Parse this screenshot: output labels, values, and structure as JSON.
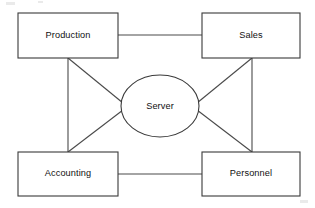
{
  "diagram": {
    "type": "network-topology",
    "background_color": "#ffffff",
    "line_color": "#4a4a4a",
    "text_color": "#111111",
    "canvas": {
      "width": 315,
      "height": 208
    },
    "nodes": [
      {
        "id": "production",
        "label": "Production",
        "shape": "rectangle",
        "x": 18,
        "y": 13,
        "width": 100,
        "height": 45,
        "cx": 68,
        "cy": 35.5
      },
      {
        "id": "sales",
        "label": "Sales",
        "shape": "rectangle",
        "x": 202,
        "y": 13,
        "width": 98,
        "height": 45,
        "cx": 251,
        "cy": 35.5
      },
      {
        "id": "accounting",
        "label": "Accounting",
        "shape": "rectangle",
        "x": 18,
        "y": 152,
        "width": 100,
        "height": 44,
        "cx": 68,
        "cy": 174
      },
      {
        "id": "personnel",
        "label": "Personnel",
        "shape": "rectangle",
        "x": 202,
        "y": 152,
        "width": 98,
        "height": 44,
        "cx": 251,
        "cy": 174
      },
      {
        "id": "server",
        "label": "Server",
        "shape": "ellipse",
        "cx": 160,
        "cy": 106,
        "rx": 39,
        "ry": 31
      }
    ],
    "edges": [
      {
        "id": "production-sales",
        "from": "production",
        "to": "sales",
        "style": "horizontal",
        "x1": 118,
        "y1": 35,
        "x2": 202,
        "y2": 35
      },
      {
        "id": "accounting-personnel",
        "from": "accounting",
        "to": "personnel",
        "style": "horizontal",
        "x1": 118,
        "y1": 174,
        "x2": 202,
        "y2": 174
      },
      {
        "id": "production-accounting",
        "from": "production",
        "to": "accounting",
        "style": "vertical",
        "x1": 68,
        "y1": 58,
        "x2": 68,
        "y2": 152
      },
      {
        "id": "sales-personnel",
        "from": "sales",
        "to": "personnel",
        "style": "vertical",
        "x1": 252,
        "y1": 58,
        "x2": 252,
        "y2": 152
      },
      {
        "id": "production-server",
        "from": "production",
        "to": "server",
        "style": "diagonal",
        "x1": 68,
        "y1": 58,
        "x2": 123,
        "y2": 104
      },
      {
        "id": "accounting-server",
        "from": "accounting",
        "to": "server",
        "style": "diagonal",
        "x1": 68,
        "y1": 152,
        "x2": 123,
        "y2": 109
      },
      {
        "id": "sales-server",
        "from": "sales",
        "to": "server",
        "style": "diagonal",
        "x1": 252,
        "y1": 58,
        "x2": 197,
        "y2": 104
      },
      {
        "id": "personnel-server",
        "from": "personnel",
        "to": "server",
        "style": "diagonal",
        "x1": 252,
        "y1": 152,
        "x2": 197,
        "y2": 109
      }
    ]
  }
}
